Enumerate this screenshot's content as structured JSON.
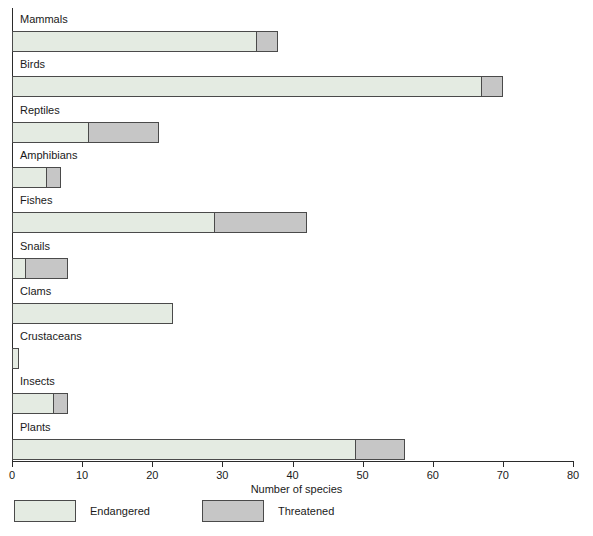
{
  "chart_data": {
    "type": "bar",
    "orientation": "horizontal",
    "stacked": true,
    "title": "",
    "xlabel": "Number of species",
    "ylabel": "",
    "xlim": [
      0,
      80
    ],
    "xticks": [
      0,
      10,
      20,
      30,
      40,
      50,
      60,
      70,
      80
    ],
    "xtick_labels": [
      "0",
      "10",
      "20",
      "30",
      "40",
      "50",
      "60",
      "70",
      "80"
    ],
    "grid": false,
    "legend_position": "bottom-left",
    "categories": [
      "Mammals",
      "Birds",
      "Reptiles",
      "Amphibians",
      "Fishes",
      "Snails",
      "Clams",
      "Crustaceans",
      "Insects",
      "Plants"
    ],
    "series": [
      {
        "name": "Endangered",
        "color": "#e4ebe2",
        "values": [
          35,
          67,
          11,
          5,
          29,
          2,
          23,
          1,
          6,
          49
        ]
      },
      {
        "name": "Threatened",
        "color": "#c6c6c6",
        "values": [
          3,
          3,
          10,
          2,
          13,
          6,
          0,
          0,
          2,
          7
        ]
      }
    ],
    "totals": [
      38,
      70,
      21,
      7,
      42,
      8,
      23,
      1,
      8,
      56
    ]
  },
  "legend": {
    "items": [
      {
        "label": "Endangered",
        "swatch": "endangered"
      },
      {
        "label": "Threatened",
        "swatch": "threatened"
      }
    ]
  },
  "axis": {
    "x_title": "Number of species"
  }
}
